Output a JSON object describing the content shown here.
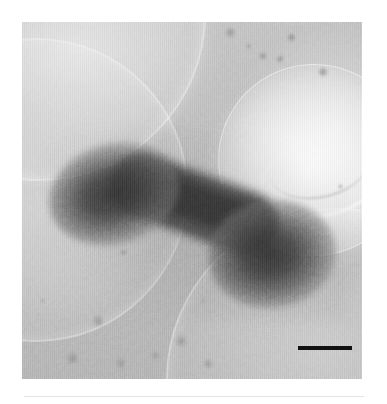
{
  "figure": {
    "modality": "TEM",
    "specimen": "dumbbell-shaped nanoparticle assembly",
    "caption": "",
    "canvas": {
      "width": 387,
      "height": 404,
      "background": "#ffffff"
    }
  },
  "micrograph": {
    "label": "electron micrograph",
    "x": 22,
    "y": 22,
    "width": 340,
    "height": 357,
    "background_gray": "#b4b4b4",
    "min_gray": "#3a3a3a",
    "max_gray": "#eeeeee",
    "noise": "fine shot noise with vertical scan striping"
  },
  "nanostructure": {
    "label": "dumbbell nanostructure",
    "shape": "dumbbell",
    "lobes": [
      {
        "name": "left-lobe",
        "cx": 92,
        "cy": 172,
        "rx": 66,
        "ry": 50,
        "rotation": -16,
        "gray": "#2e2e2e"
      },
      {
        "name": "right-lobe",
        "cx": 250,
        "cy": 232,
        "rx": 64,
        "ry": 54,
        "rotation": -8,
        "gray": "#2c2c2c"
      }
    ],
    "linker": {
      "name": "connecting-rod",
      "x1": 96,
      "y1": 186,
      "x2": 248,
      "y2": 236,
      "thickness": 38,
      "gray": "#343434"
    }
  },
  "support_film": {
    "label": "holey carbon support film",
    "holes": [
      {
        "name": "hole-upper-left",
        "cx": 15,
        "cy": -10,
        "r": 165
      },
      {
        "name": "hole-left-mid",
        "cx": 12,
        "cy": 166,
        "r": 150
      },
      {
        "name": "hole-lower-right",
        "cx": 314,
        "cy": 356,
        "r": 170
      },
      {
        "name": "hole-upper-right",
        "cx": 291,
        "cy": 137,
        "r": 95
      }
    ],
    "bright_region": {
      "name": "bright-hole",
      "cx": 291,
      "cy": 137
    }
  },
  "contamination": {
    "label": "contamination particles",
    "specks": [
      {
        "x": 230,
        "y": 32,
        "d": 11,
        "gray": "#8e8e8e"
      },
      {
        "x": 249,
        "y": 46,
        "d": 6,
        "gray": "#969696"
      },
      {
        "x": 263,
        "y": 56,
        "d": 8,
        "gray": "#8a8a8a"
      },
      {
        "x": 280,
        "y": 59,
        "d": 8,
        "gray": "#8d8d8d"
      },
      {
        "x": 291,
        "y": 37,
        "d": 9,
        "gray": "#898989"
      },
      {
        "x": 323,
        "y": 72,
        "d": 10,
        "gray": "#8c8c8c"
      },
      {
        "x": 305,
        "y": 220,
        "d": 7,
        "gray": "#8f8f8f"
      },
      {
        "x": 313,
        "y": 227,
        "d": 4,
        "gray": "#9a9a9a"
      },
      {
        "x": 123,
        "y": 252,
        "d": 7,
        "gray": "#8f8f8f"
      },
      {
        "x": 98,
        "y": 321,
        "d": 12,
        "gray": "#909090"
      },
      {
        "x": 72,
        "y": 358,
        "d": 13,
        "gray": "#8e8e8e"
      },
      {
        "x": 120,
        "y": 363,
        "d": 11,
        "gray": "#919191"
      },
      {
        "x": 155,
        "y": 355,
        "d": 9,
        "gray": "#949494"
      },
      {
        "x": 181,
        "y": 341,
        "d": 12,
        "gray": "#8f8f8f"
      },
      {
        "x": 208,
        "y": 364,
        "d": 10,
        "gray": "#929292"
      },
      {
        "x": 42,
        "y": 300,
        "d": 5,
        "gray": "#9d9d9d"
      },
      {
        "x": 203,
        "y": 300,
        "d": 5,
        "gray": "#9d9d9d"
      },
      {
        "x": 340,
        "y": 186,
        "d": 5,
        "gray": "#9b9b9b"
      }
    ]
  },
  "scale_bar": {
    "label": "scale bar",
    "x": 298,
    "y": 346,
    "length_px": 54,
    "thickness_px": 4,
    "color": "#111111",
    "text": ""
  },
  "separator": {
    "label": "caption rule",
    "y": 396,
    "color": "#e2e2e2"
  }
}
